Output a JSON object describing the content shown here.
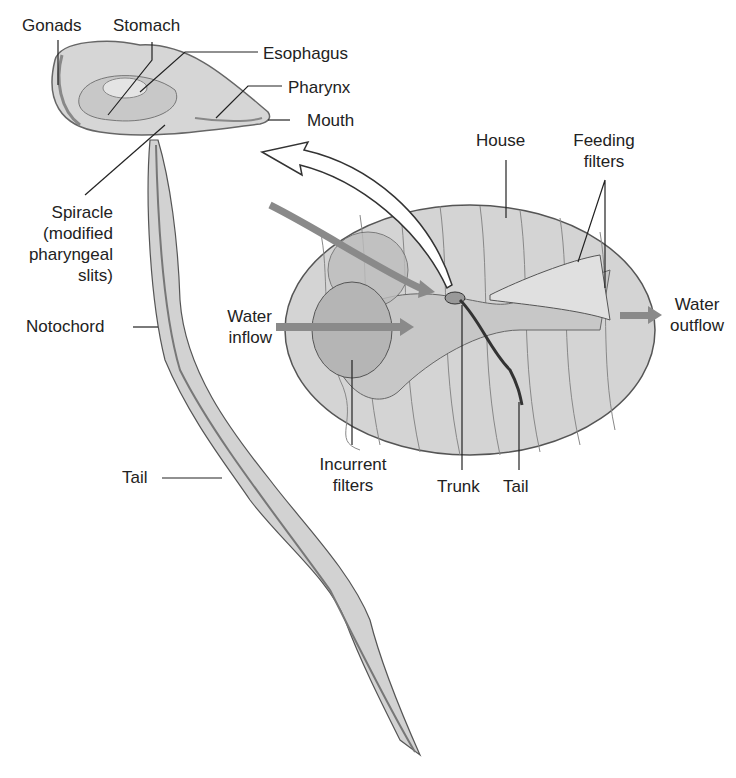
{
  "labels": {
    "gonads": "Gonads",
    "stomach": "Stomach",
    "esophagus": "Esophagus",
    "pharynx": "Pharynx",
    "mouth": "Mouth",
    "spiracle_1": "Spiracle",
    "spiracle_2": "(modified",
    "spiracle_3": "pharyngeal",
    "spiracle_4": "slits)",
    "notochord": "Notochord",
    "tail_left": "Tail",
    "house": "House",
    "feeding_1": "Feeding",
    "feeding_2": "filters",
    "water_in_1": "Water",
    "water_in_2": "inflow",
    "water_out_1": "Water",
    "water_out_2": "outflow",
    "incurrent_1": "Incurrent",
    "incurrent_2": "filters",
    "trunk": "Trunk",
    "tail_right": "Tail"
  },
  "colors": {
    "body": "#d9d9d9",
    "outline": "#555555",
    "arrow": "#8a8a8a",
    "text": "#222222"
  }
}
